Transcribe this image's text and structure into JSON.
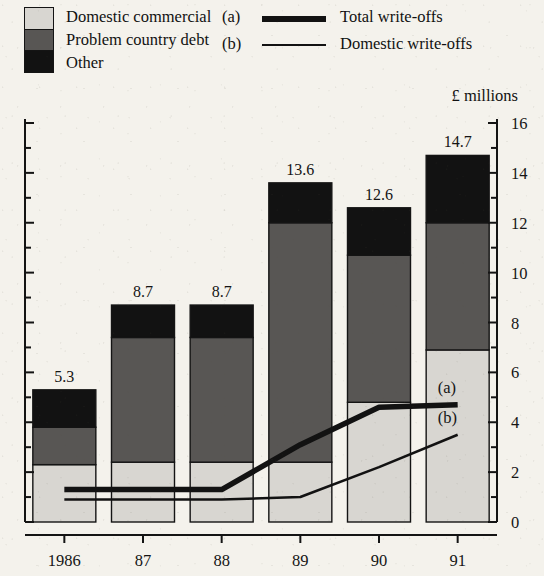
{
  "legend": {
    "stack_items": [
      {
        "label": "Domestic commercial",
        "color": "#d8d6d1"
      },
      {
        "label": "Problem country debt",
        "color": "#585654"
      },
      {
        "label": "Other",
        "color": "#121212"
      }
    ],
    "line_items": [
      {
        "tag": "(a)",
        "label": "Total write-offs",
        "color": "#121212",
        "weight": "thick"
      },
      {
        "tag": "(b)",
        "label": "Domestic write-offs",
        "color": "#121212",
        "weight": "thin"
      }
    ]
  },
  "axis_unit_caption": "£ millions",
  "annotations": [
    {
      "name": "line-a-end-label",
      "text": "(a)"
    },
    {
      "name": "line-b-end-label",
      "text": "(b)"
    }
  ],
  "chart_data": {
    "type": "bar",
    "title": "",
    "subtitle": "",
    "xlabel": "",
    "ylabel": "£ millions",
    "ylim": [
      0,
      16
    ],
    "yticks": [
      0,
      2,
      4,
      6,
      8,
      10,
      12,
      14,
      16
    ],
    "yticks_minor": [
      1,
      3,
      5,
      7,
      9,
      11,
      13,
      15
    ],
    "ytick_labels": [
      "0",
      "2",
      "4",
      "6",
      "8",
      "10",
      "12",
      "14",
      "16"
    ],
    "y_axis_position": "right",
    "grid": false,
    "legend_position": "top",
    "stacked": true,
    "categories": [
      "1986",
      "87",
      "88",
      "89",
      "90",
      "91"
    ],
    "series": [
      {
        "name": "Domestic commercial",
        "color": "#d8d6d1",
        "values": [
          2.3,
          2.4,
          2.4,
          2.4,
          4.8,
          6.9
        ]
      },
      {
        "name": "Problem country debt",
        "color": "#585654",
        "values": [
          1.5,
          5.0,
          5.0,
          9.6,
          5.9,
          5.1
        ]
      },
      {
        "name": "Other",
        "color": "#121212",
        "values": [
          1.5,
          1.3,
          1.3,
          1.6,
          1.9,
          2.7
        ]
      }
    ],
    "bar_totals": [
      5.3,
      8.7,
      8.7,
      13.6,
      12.6,
      14.7
    ],
    "bar_total_labels": [
      "5.3",
      "8.7",
      "8.7",
      "13.6",
      "12.6",
      "14.7"
    ],
    "overlay_lines": [
      {
        "name": "Total write-offs",
        "tag": "(a)",
        "color": "#121212",
        "width": 5.5,
        "values": [
          1.3,
          1.3,
          1.3,
          3.1,
          4.6,
          4.7
        ]
      },
      {
        "name": "Domestic write-offs",
        "tag": "(b)",
        "color": "#121212",
        "width": 2.6,
        "values": [
          0.9,
          0.9,
          0.9,
          1.0,
          2.2,
          3.5
        ]
      }
    ]
  }
}
